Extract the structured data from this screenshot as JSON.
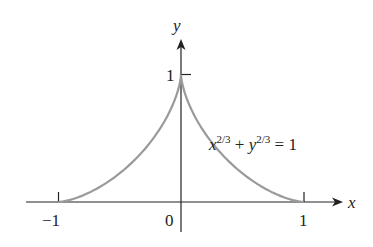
{
  "chart_data": {
    "type": "line",
    "title": "",
    "xlabel": "x",
    "ylabel": "y",
    "xlim": [
      -1.35,
      1.2
    ],
    "ylim": [
      -0.25,
      1.5
    ],
    "grid": false,
    "x_ticks": [
      -1,
      0,
      1
    ],
    "x_tick_labels": [
      "−1",
      "0",
      "1"
    ],
    "y_ticks": [
      1
    ],
    "y_tick_labels": [
      "1"
    ],
    "series": [
      {
        "name": "x^(2/3) + y^(2/3) = 1 (upper half)",
        "color": "#9a9a9a",
        "x": [
          -1,
          -0.9,
          -0.8,
          -0.7,
          -0.6,
          -0.5,
          -0.4,
          -0.3,
          -0.2,
          -0.1,
          0,
          0.1,
          0.2,
          0.3,
          0.4,
          0.5,
          0.6,
          0.7,
          0.8,
          0.9,
          1
        ],
        "y": [
          0,
          0.0049,
          0.0315,
          0.0886,
          0.1841,
          0.3264,
          0.5216,
          0.7773,
          1.1,
          1.5,
          1,
          1.5,
          1.1,
          0.7773,
          0.5216,
          0.3264,
          0.1841,
          0.0886,
          0.0315,
          0.0049,
          0
        ]
      }
    ],
    "annotations": [
      {
        "text": "x^{2/3} + y^{2/3} = 1",
        "x": 0.15,
        "y": 0.55
      }
    ]
  },
  "labels": {
    "x_axis": "x",
    "y_axis": "y",
    "tick_neg1": "−1",
    "tick_0": "0",
    "tick_pos1": "1",
    "tick_y1": "1",
    "equation": {
      "x": "x",
      "exp1": "2/3",
      "plus": " + ",
      "y": "y",
      "exp2": "2/3",
      "equals": " = 1"
    }
  },
  "colors": {
    "axis": "#222222",
    "curve": "#9a9a9a",
    "background": "#ffffff"
  }
}
